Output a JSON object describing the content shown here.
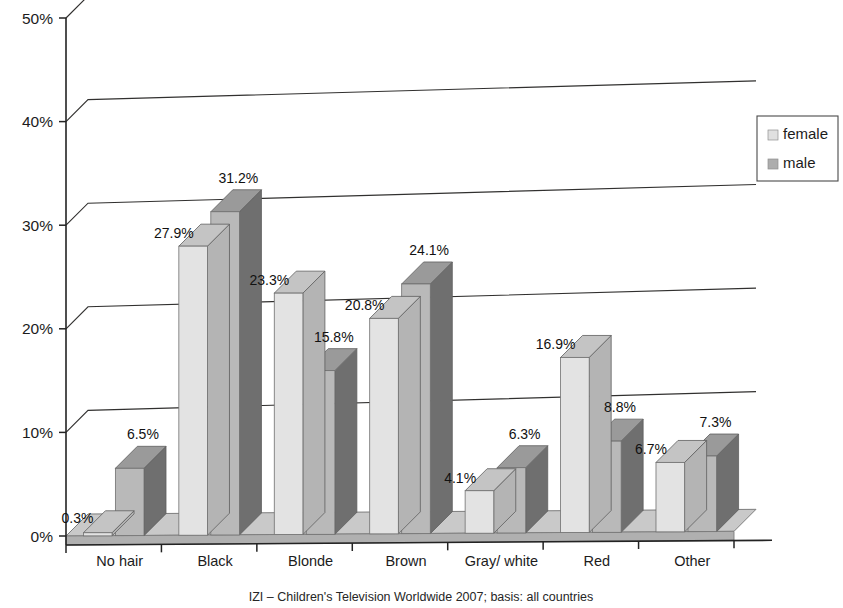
{
  "chart_data": {
    "type": "bar",
    "title": "",
    "subtitle": "",
    "xlabel": "",
    "ylabel": "",
    "ylim": [
      0,
      50
    ],
    "ytick_values": [
      0,
      10,
      20,
      30,
      40,
      50
    ],
    "ytick_labels": [
      "0%",
      "10%",
      "20%",
      "30%",
      "40%",
      "50%"
    ],
    "grid": true,
    "three_d": true,
    "legend_position": "right",
    "value_suffix": "%",
    "categories": [
      "No hair",
      "Black",
      "Blonde",
      "Brown",
      "Gray/ white",
      "Red",
      "Other"
    ],
    "series": [
      {
        "name": "female",
        "color": "#e3e3e3",
        "top_color": "#c4c4c4",
        "side_color": "#b4b4b4",
        "values": [
          0.3,
          27.9,
          23.3,
          20.8,
          4.1,
          16.9,
          6.7
        ],
        "labels": [
          "0.3%",
          "27.9%",
          "23.3%",
          "20.8%",
          "4.1%",
          "16.9%",
          "6.7%"
        ]
      },
      {
        "name": "male",
        "color": "#b9b9b9",
        "top_color": "#9a9a9a",
        "side_color": "#6f6f6f",
        "values": [
          6.5,
          31.2,
          15.8,
          24.1,
          6.3,
          8.8,
          7.3
        ],
        "labels": [
          "6.5%",
          "31.2%",
          "15.8%",
          "24.1%",
          "6.3%",
          "8.8%",
          "7.3%"
        ]
      }
    ]
  },
  "legend": {
    "entries": [
      {
        "label": "female",
        "swatch_color": "#e0e0e0"
      },
      {
        "label": "male",
        "swatch_color": "#adadad"
      }
    ]
  },
  "caption": {
    "text": "IZI – Children's Television Worldwide 2007; basis: all countries"
  },
  "colors": {
    "background": "#ffffff",
    "axis": "#232323",
    "grid": "#31302f",
    "floor_top": "#c9c9c9",
    "floor_front": "#b0b0b0",
    "text": "#1c1c1c"
  }
}
